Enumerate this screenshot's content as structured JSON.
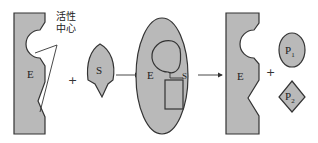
{
  "diagram": {
    "colors": {
      "shape_fill": "#b9b9b9",
      "stroke": "#333333",
      "background": "#ffffff"
    },
    "enzyme_left": {
      "label": "E"
    },
    "active_site_label": "活性中心",
    "active_site_label_line1": "活性",
    "active_site_label_line2": "中心",
    "plus_1": "+",
    "substrate": {
      "label": "S"
    },
    "complex": {
      "enzyme_label": "E",
      "substrate_label": "S"
    },
    "enzyme_right": {
      "label": "E"
    },
    "plus_2": "+",
    "product_1": {
      "label": "P",
      "subscript": "1"
    },
    "product_2": {
      "label": "P",
      "subscript": "2"
    },
    "arrows": [
      "arrow-to-complex",
      "arrow-to-products"
    ]
  }
}
